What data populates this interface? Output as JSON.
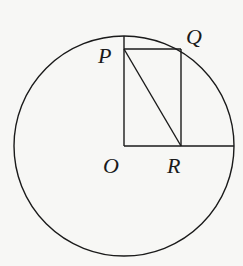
{
  "diagram": {
    "type": "geometry",
    "circle": {
      "center": "O",
      "cx": 124,
      "cy": 146,
      "r": 110
    },
    "points": {
      "O": {
        "label": "O",
        "x": 124,
        "y": 146
      },
      "P": {
        "label": "P",
        "x": 124,
        "y": 49
      },
      "Q": {
        "label": "Q",
        "x": 181,
        "y": 49
      },
      "R": {
        "label": "R",
        "x": 181,
        "y": 146
      }
    },
    "segments": [
      "O-top of circle (radius)",
      "O-right of circle (radius)",
      "P-Q",
      "Q-R",
      "P-R"
    ],
    "stroke_color": "#1a1a1a",
    "background_color": "#f7f7f5"
  }
}
